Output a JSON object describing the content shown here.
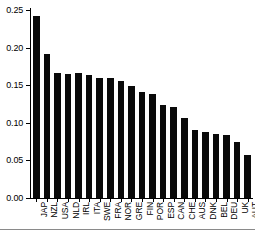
{
  "chart_data": {
    "type": "bar",
    "title": "",
    "subtitle": "",
    "xlabel": "",
    "ylabel": "",
    "categories": [
      "JAP",
      "NZL",
      "USA",
      "NLD",
      "IRL",
      "ITA",
      "SWE",
      "FRA",
      "NOR",
      "GRE",
      "FIN",
      "POR",
      "ESP",
      "CAN",
      "CHE",
      "AUS",
      "DNK",
      "BEL",
      "DEU",
      "UK",
      "AUT"
    ],
    "values": [
      0.242,
      0.192,
      0.166,
      0.165,
      0.166,
      0.164,
      0.159,
      0.159,
      0.155,
      0.149,
      0.141,
      0.138,
      0.124,
      0.121,
      0.107,
      0.091,
      0.088,
      0.085,
      0.084,
      0.075,
      0.057
    ],
    "ylim": [
      0.0,
      0.25
    ],
    "ytick_labels": [
      "0.00",
      "0.05",
      "0.10",
      "0.15",
      "0.20",
      "0.25"
    ],
    "ytick_values": [
      0.0,
      0.05,
      0.1,
      0.15,
      0.2,
      0.25
    ],
    "grid": false,
    "legend": null,
    "bar_color": "#0a0a0a",
    "axis_color": "#000000",
    "background": "#ffffff"
  },
  "figure": {
    "clipped_caption_text": ""
  }
}
